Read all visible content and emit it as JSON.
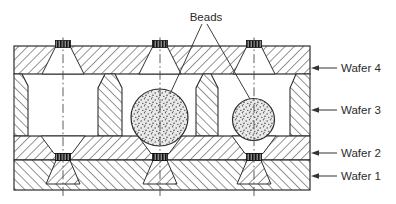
{
  "figure": {
    "beads_label": "Beads",
    "wafer_labels": [
      "Wafer 4",
      "Wafer 3",
      "Wafer 2",
      "Wafer 1"
    ],
    "colors": {
      "line": "#2e2e2e",
      "hatch": "#3d3d3d",
      "pad_fill": "#141414",
      "pad_stripe": "#e8e8e8",
      "bead_fill": "#e9e9e9",
      "bead_speckle": "#4f4f4f",
      "centerline": "#4a4a4a",
      "background": "#ffffff"
    }
  }
}
